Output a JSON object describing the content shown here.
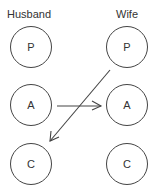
{
  "columns": {
    "husband": "Husband",
    "wife": "Wife"
  },
  "nodes": {
    "husband": [
      {
        "id": "husband-parent",
        "label": "P",
        "cx": 31,
        "cy": 47
      },
      {
        "id": "husband-adult",
        "label": "A",
        "cx": 31,
        "cy": 105
      },
      {
        "id": "husband-child",
        "label": "C",
        "cx": 31,
        "cy": 164
      }
    ],
    "wife": [
      {
        "id": "wife-parent",
        "label": "P",
        "cx": 127,
        "cy": 47
      },
      {
        "id": "wife-adult",
        "label": "A",
        "cx": 127,
        "cy": 105
      },
      {
        "id": "wife-child",
        "label": "C",
        "cx": 127,
        "cy": 164
      }
    ]
  },
  "edges": [
    {
      "from": "husband-adult",
      "to": "wife-adult"
    },
    {
      "from": "wife-parent",
      "to": "husband-child"
    }
  ],
  "colors": {
    "stroke": "#444444",
    "text": "#333333"
  }
}
